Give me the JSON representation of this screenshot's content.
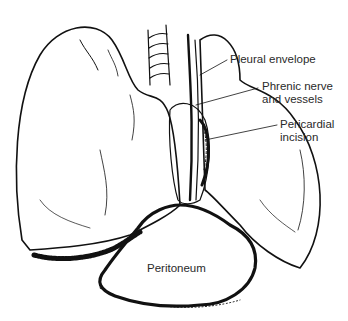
{
  "figure": {
    "style": "black-and-white pen-and-ink",
    "colors": {
      "ink": "#111111",
      "background": "#ffffff",
      "label_text": "#2a2a2a"
    }
  },
  "labels": {
    "pleural_envelope": "Pleural envelope",
    "phrenic_nerve": "Phrenic nerve\nand vessels",
    "pericardial_incision": "Pericardial\nincision",
    "peritoneum": "Peritoneum"
  }
}
